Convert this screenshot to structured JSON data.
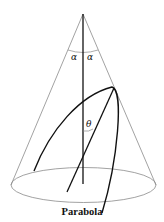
{
  "diagram": {
    "caption": "Parabola",
    "labels": {
      "alpha_left": "α",
      "alpha_right": "α",
      "theta": "θ"
    },
    "colors": {
      "cone_outline": "#8a8a8a",
      "curve": "#111111",
      "axis": "#111111",
      "background": "#ffffff"
    },
    "elements": [
      "cone",
      "axis",
      "base-ellipse",
      "parabola-curve",
      "inclined-line",
      "alpha-angle",
      "theta-angle"
    ]
  }
}
